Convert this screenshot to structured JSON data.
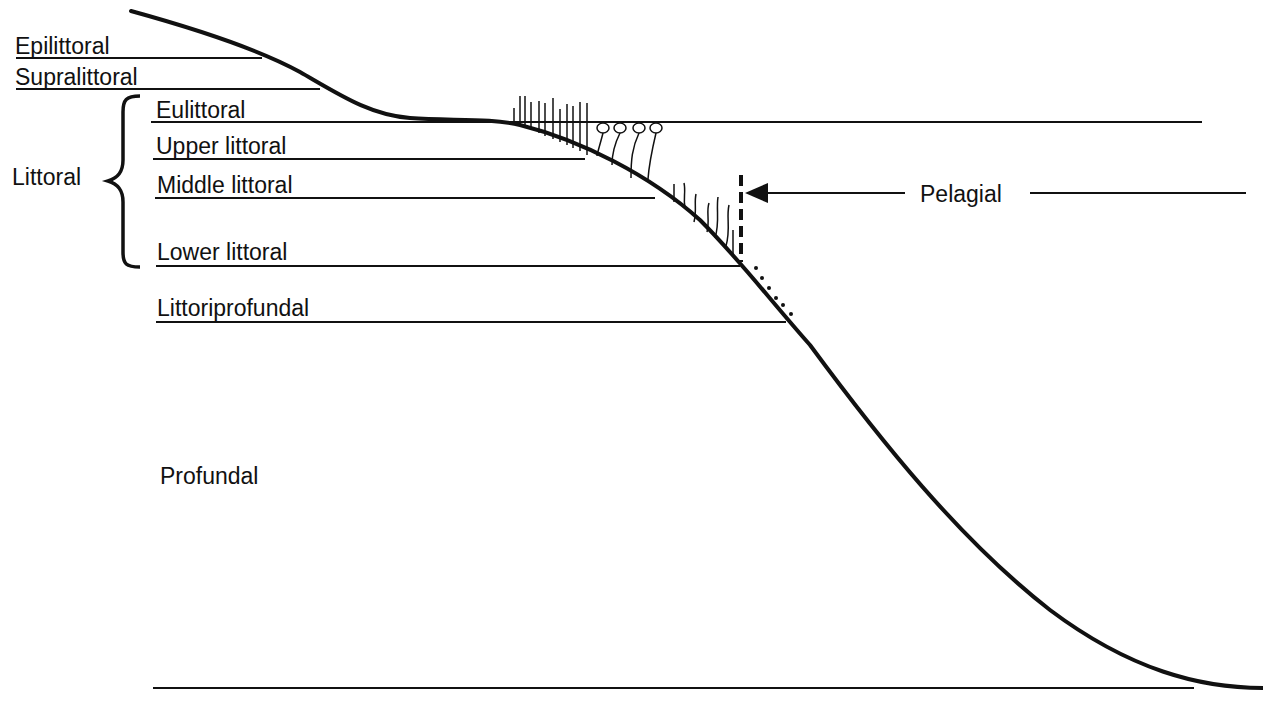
{
  "diagram": {
    "zones": {
      "epilittoral": "Epilittoral",
      "supralittoral": "Supralittoral",
      "littoral": "Littoral",
      "eulittoral": "Eulittoral",
      "upper_littoral": "Upper littoral",
      "middle_littoral": "Middle littoral",
      "lower_littoral": "Lower littoral",
      "littoriprofundal": "Littoriprofundal",
      "profundal": "Profundal",
      "pelagial": "Pelagial"
    },
    "colors": {
      "ink": "#111111",
      "background": "#ffffff"
    }
  }
}
